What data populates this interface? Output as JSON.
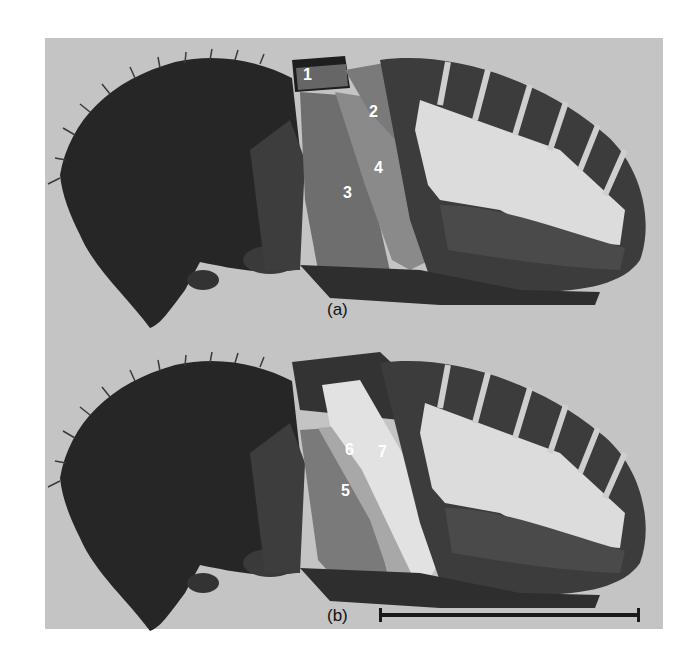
{
  "figure": {
    "panels": [
      {
        "caption": "(a)",
        "labels": [
          {
            "text": "1",
            "x": 303,
            "y": 67
          },
          {
            "text": "2",
            "x": 369,
            "y": 104
          },
          {
            "text": "3",
            "x": 343,
            "y": 185
          },
          {
            "text": "4",
            "x": 374,
            "y": 160
          }
        ]
      },
      {
        "caption": "(b)",
        "labels": [
          {
            "text": "5",
            "x": 341,
            "y": 483
          },
          {
            "text": "6",
            "x": 345,
            "y": 442
          },
          {
            "text": "7",
            "x": 378,
            "y": 444
          }
        ]
      }
    ],
    "scale_bar": {
      "visible": true
    },
    "colors": {
      "background": "#c4c4c4",
      "specimen_dark": "#2a2a2a",
      "muscle_mid": "#7a7a7a",
      "muscle_light": "#d8d8d8",
      "label": "#ffffff"
    }
  }
}
